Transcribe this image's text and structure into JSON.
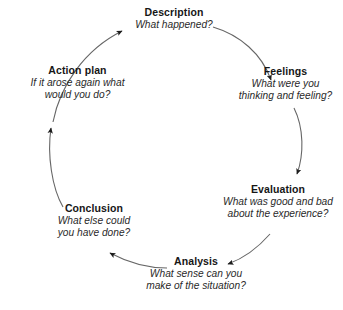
{
  "diagram": {
    "type": "cyclic-process-diagram",
    "name": "Gibbs' Reflective Cycle",
    "direction": "clockwise",
    "background_color": "#ffffff",
    "arc_color": "#666666",
    "arrow_color": "#1c1c1c",
    "text_color": "#1c1c1c",
    "stages": [
      {
        "id": "description",
        "title": "Description",
        "question": "What happened?"
      },
      {
        "id": "feelings",
        "title": "Feelings",
        "question": "What were you\nthinking and feeling?"
      },
      {
        "id": "evaluation",
        "title": "Evaluation",
        "question": "What was good and bad\nabout the experience?"
      },
      {
        "id": "analysis",
        "title": "Analysis",
        "question": "What sense can you\nmake of the situation?"
      },
      {
        "id": "conclusion",
        "title": "Conclusion",
        "question": "What else could\nyou have done?"
      },
      {
        "id": "action_plan",
        "title": "Action plan",
        "question": "If it arose again what\nwould you do?"
      }
    ],
    "arrows": [
      {
        "id": "action-plan-to-description",
        "from": "action_plan",
        "to": "description"
      },
      {
        "id": "description-to-feelings",
        "from": "description",
        "to": "feelings"
      },
      {
        "id": "feelings-to-evaluation",
        "from": "feelings",
        "to": "evaluation"
      },
      {
        "id": "evaluation-to-analysis",
        "from": "evaluation",
        "to": "analysis"
      },
      {
        "id": "analysis-to-conclusion",
        "from": "analysis",
        "to": "conclusion"
      },
      {
        "id": "conclusion-to-action-plan",
        "from": "conclusion",
        "to": "action_plan"
      }
    ]
  }
}
